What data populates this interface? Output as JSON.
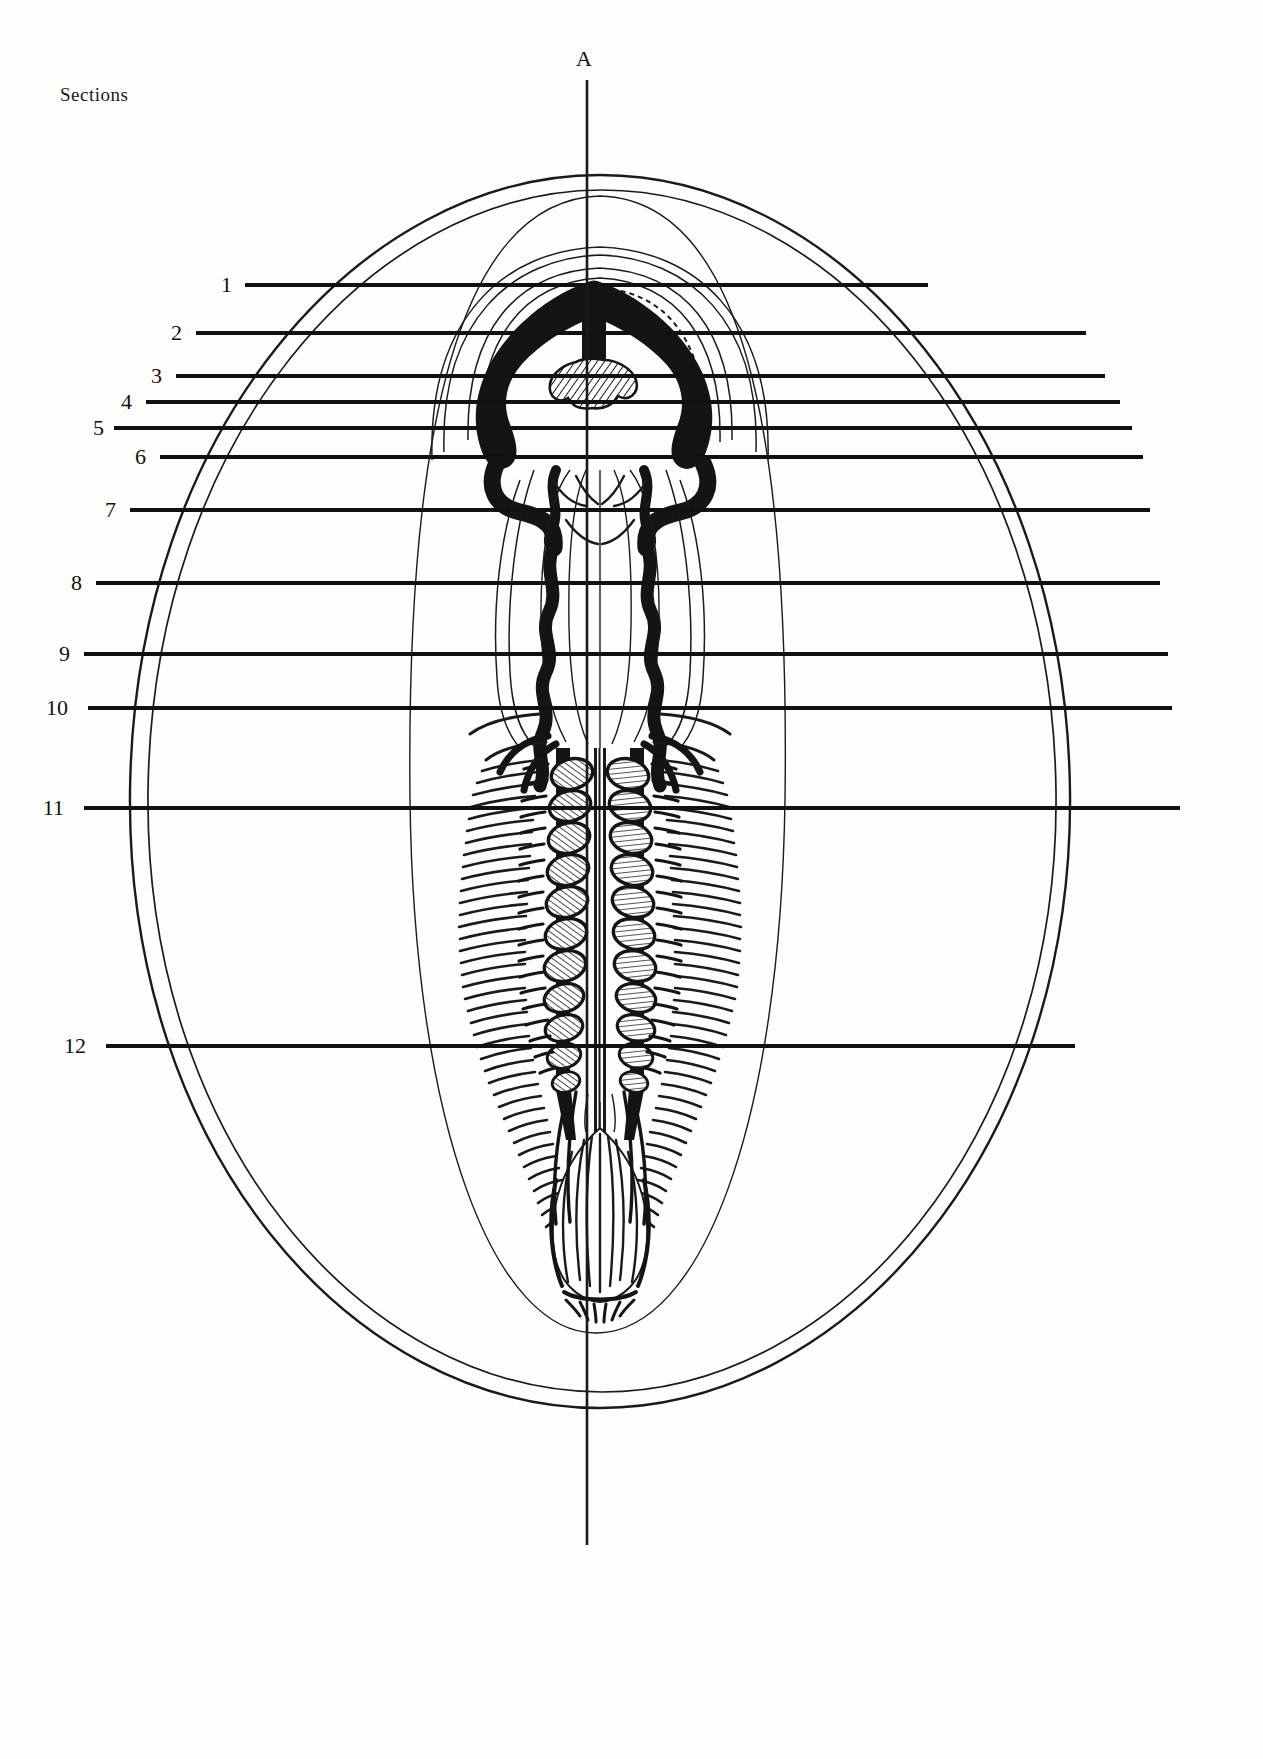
{
  "page": {
    "width": 1263,
    "height": 1759,
    "background": "#fdfdfc",
    "ink": "#111111"
  },
  "header": {
    "sections_title": "Sections"
  },
  "axis": {
    "letter": "A",
    "letter_x": 576,
    "letter_y": 46,
    "line_x": 587,
    "line_top": 80,
    "line_bottom": 1545
  },
  "figure": {
    "caption_free": true,
    "outline": {
      "outer_ellipse_cx": 600,
      "outer_ellipse_cy": 790,
      "outer_ellipse_rx": 470,
      "outer_ellipse_ry": 615,
      "inner_ellipse_cx": 600,
      "inner_ellipse_cy": 790,
      "inner_ellipse_rx": 455,
      "inner_ellipse_ry": 600
    }
  },
  "section_lines": [
    {
      "label": "1",
      "y": 285,
      "label_x": 232,
      "line_start": 245,
      "line_end": 928
    },
    {
      "label": "2",
      "y": 333,
      "label_x": 182,
      "line_start": 196,
      "line_end": 1086
    },
    {
      "label": "3",
      "y": 376,
      "label_x": 162,
      "line_start": 176,
      "line_end": 1105
    },
    {
      "label": "4",
      "y": 402,
      "label_x": 132,
      "line_start": 146,
      "line_end": 1120
    },
    {
      "label": "5",
      "y": 428,
      "label_x": 104,
      "line_start": 114,
      "line_end": 1132
    },
    {
      "label": "6",
      "y": 457,
      "label_x": 146,
      "line_start": 160,
      "line_end": 1143
    },
    {
      "label": "7",
      "y": 510,
      "label_x": 116,
      "line_start": 130,
      "line_end": 1150
    },
    {
      "label": "8",
      "y": 583,
      "label_x": 82,
      "line_start": 96,
      "line_end": 1160
    },
    {
      "label": "9",
      "y": 654,
      "label_x": 70,
      "line_start": 84,
      "line_end": 1168
    },
    {
      "label": "10",
      "y": 708,
      "label_x": 68,
      "line_start": 88,
      "line_end": 1172
    },
    {
      "label": "11",
      "y": 808,
      "label_x": 64,
      "line_start": 84,
      "line_end": 1180
    },
    {
      "label": "12",
      "y": 1046,
      "label_x": 86,
      "line_start": 106,
      "line_end": 1075
    }
  ],
  "chart_data": {
    "type": "diagram",
    "title": "Sections",
    "axis_label": "A",
    "section_count": 12,
    "section_labels": [
      "1",
      "2",
      "3",
      "4",
      "5",
      "6",
      "7",
      "8",
      "9",
      "10",
      "11",
      "12"
    ],
    "section_y_positions": [
      285,
      333,
      376,
      402,
      428,
      457,
      510,
      583,
      654,
      708,
      808,
      1046
    ]
  }
}
